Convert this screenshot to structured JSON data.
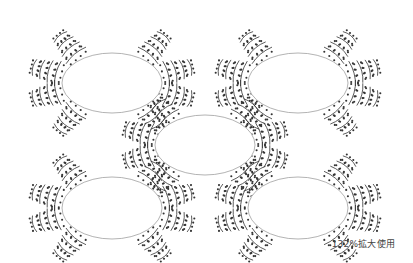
{
  "caption": "132%拡大使用",
  "colors": {
    "stitch": "#333333",
    "ellipse_stroke": "#aaaaaa",
    "ellipse_fill": "#ffffff"
  },
  "motifs": [
    {
      "name": "motif-top-left",
      "cx": 112,
      "cy": 83,
      "rx": 50,
      "ry": 30
    },
    {
      "name": "motif-top-right",
      "cx": 298,
      "cy": 83,
      "rx": 50,
      "ry": 30
    },
    {
      "name": "motif-middle",
      "cx": 205,
      "cy": 145,
      "rx": 50,
      "ry": 30
    },
    {
      "name": "motif-bottom-left",
      "cx": 112,
      "cy": 208,
      "rx": 50,
      "ry": 31
    },
    {
      "name": "motif-bottom-right",
      "cx": 298,
      "cy": 208,
      "rx": 50,
      "ry": 31
    }
  ]
}
